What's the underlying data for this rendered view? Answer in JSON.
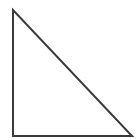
{
  "diagram": {
    "shape": "right-triangle",
    "stroke_color": "#3a3a3a",
    "fill_color": "#ffffff",
    "stroke_width": 2,
    "vertices": {
      "top": [
        13,
        10
      ],
      "bottom_left": [
        13,
        136
      ],
      "bottom_right": [
        132,
        136
      ]
    }
  }
}
